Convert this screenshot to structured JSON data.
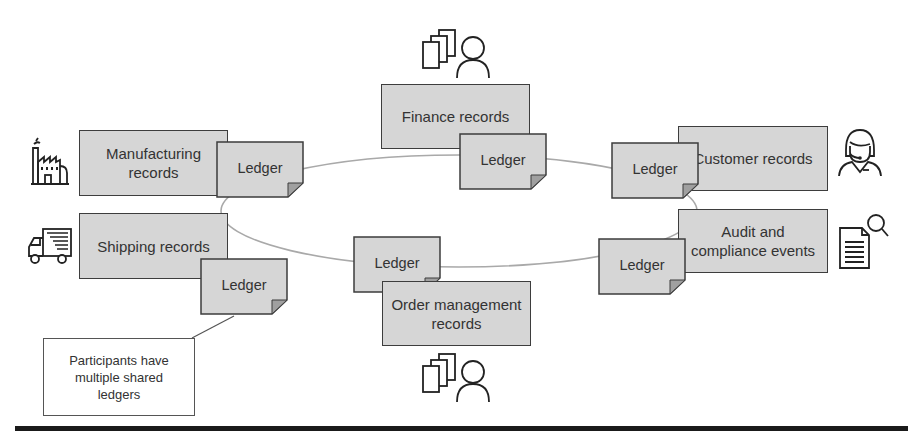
{
  "diagram": {
    "title_fragment": "",
    "ring": {
      "cx": 459,
      "cy": 211,
      "rx": 238,
      "ry": 56,
      "stroke": "#a9a9a9"
    },
    "colors": {
      "box_fill": "#d6d6d6",
      "box_border": "#3d3d3d",
      "fold": "#a0a0a0",
      "rule": "#1a1a1a"
    },
    "participants": [
      {
        "id": "manufacturing",
        "label": "Manufacturing records",
        "icon": "factory-icon",
        "ledger_label": "Ledger"
      },
      {
        "id": "shipping",
        "label": "Shipping records",
        "icon": "delivery-truck-icon",
        "ledger_label": "Ledger"
      },
      {
        "id": "finance",
        "label": "Finance records",
        "icon": "documents-person-icon",
        "ledger_label": "Ledger"
      },
      {
        "id": "customer",
        "label": "Customer records",
        "icon": "customer-support-headset-icon",
        "ledger_label": "Ledger"
      },
      {
        "id": "audit",
        "label": "Audit and compliance events",
        "icon": "document-search-icon",
        "ledger_label": "Ledger"
      },
      {
        "id": "order",
        "label": "Order management records",
        "icon": "documents-person-icon",
        "ledger_label": "Ledger"
      }
    ],
    "callout": {
      "text": "Participants have multiple shared ledgers"
    }
  }
}
